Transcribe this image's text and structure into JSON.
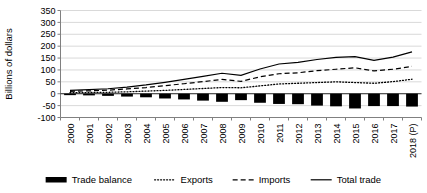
{
  "chart_data": {
    "type": "bar",
    "title": "",
    "xlabel": "",
    "ylabel": "Billions of dollars",
    "ylim": [
      -100,
      350
    ],
    "yticks": [
      -100,
      -50,
      0,
      50,
      100,
      150,
      200,
      250,
      300,
      350
    ],
    "ytick_labels": [
      "-100",
      "-50",
      "0",
      "50",
      "100",
      "150",
      "200",
      "250",
      "300",
      "350"
    ],
    "grid": true,
    "legend_position": "bottom",
    "categories": [
      "2000",
      "2001",
      "2002",
      "2003",
      "2004",
      "2005",
      "2006",
      "2007",
      "2008",
      "2009",
      "2010",
      "2011",
      "2012",
      "2013",
      "2014",
      "2015",
      "2016",
      "2017",
      "2018 (P)"
    ],
    "series": [
      {
        "name": "Trade balance",
        "style": "bar",
        "values": [
          -6,
          -7,
          -9,
          -12,
          -15,
          -20,
          -24,
          -29,
          -34,
          -27,
          -38,
          -43,
          -44,
          -50,
          -53,
          -62,
          -52,
          -52,
          -54
        ]
      },
      {
        "name": "Exports",
        "style": "dotted-line",
        "values": [
          4,
          5,
          6,
          8,
          11,
          14,
          18,
          22,
          26,
          25,
          33,
          41,
          44,
          47,
          50,
          47,
          44,
          51,
          61
        ]
      },
      {
        "name": "Imports",
        "style": "dashed-line",
        "values": [
          10,
          12,
          15,
          20,
          26,
          34,
          42,
          51,
          60,
          52,
          71,
          84,
          88,
          97,
          103,
          109,
          96,
          103,
          115
        ]
      },
      {
        "name": "Total trade",
        "style": "solid-line",
        "values": [
          14,
          17,
          21,
          28,
          37,
          48,
          60,
          73,
          86,
          77,
          104,
          125,
          132,
          144,
          153,
          156,
          140,
          154,
          176
        ]
      }
    ]
  },
  "legend": {
    "items": [
      {
        "label": "Trade balance",
        "marker": "bar-swatch"
      },
      {
        "label": "Exports",
        "marker": "dotted-line-swatch"
      },
      {
        "label": "Imports",
        "marker": "dashed-line-swatch"
      },
      {
        "label": "Total trade",
        "marker": "solid-line-swatch"
      }
    ]
  },
  "colors": {
    "series": "#000000",
    "grid": "#d9d9d9",
    "axis": "#808080",
    "background": "#ffffff"
  }
}
